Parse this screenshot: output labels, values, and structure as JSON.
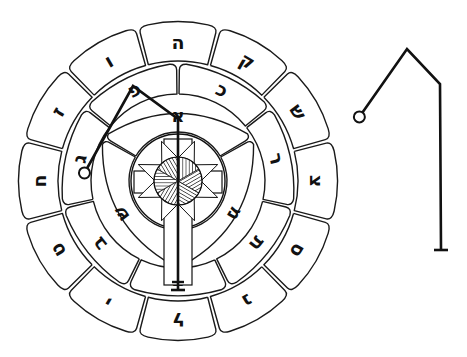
{
  "diagram": {
    "title": "Rose cross sigil wheel",
    "colors": {
      "ink": "#111111",
      "background": "#ffffff"
    },
    "wheel": {
      "center": [
        178,
        181
      ],
      "outer_ring": {
        "radius_outer": 160,
        "radius_inner": 118,
        "start_angle_deg": -105,
        "letters": [
          "ה",
          "ק",
          "ש",
          "צ",
          "ס",
          "נ",
          "ל",
          "י",
          "ט",
          "ח",
          "ז",
          "ו"
        ]
      },
      "middle_ring": {
        "radius_outer": 118,
        "radius_inner": 85,
        "start_angle_deg": -90,
        "letters": [
          "כ",
          "ר",
          "ת",
          "ד",
          "ב",
          "ג",
          "פ"
        ]
      },
      "inner_ring": {
        "radius_outer": 85,
        "radius_inner": 47,
        "start_angle_deg": -150,
        "letters": [
          "א",
          "מ",
          "ש"
        ]
      },
      "center_emblem": {
        "circle_radius": 47,
        "disc_radius": 24,
        "elements": [
          "cross",
          "eight-point-star",
          "hatched-disc"
        ]
      }
    },
    "sigil_overlay": {
      "points": [
        [
          85,
          172
        ],
        [
          133,
          86
        ],
        [
          178,
          119
        ],
        [
          178,
          290
        ]
      ],
      "start": "circle",
      "end": "bar"
    },
    "sigil_standalone": {
      "points": [
        [
          360,
          116
        ],
        [
          407,
          49
        ],
        [
          440,
          84
        ],
        [
          441,
          250
        ]
      ],
      "start": "circle",
      "end": "bar"
    }
  }
}
